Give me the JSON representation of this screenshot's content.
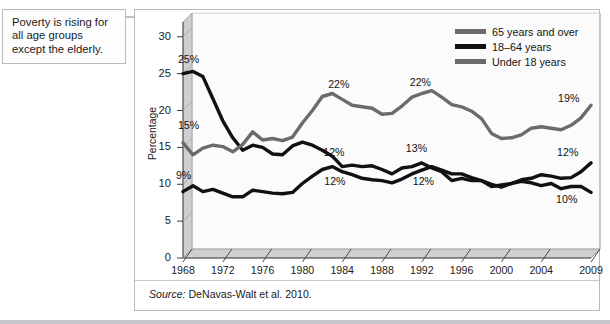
{
  "callout": {
    "text": "Poverty is rising for all age groups except the elderly.",
    "arrow_icon": "arrow-right-icon"
  },
  "source": {
    "label": "Source:",
    "citation": " DeNavas-Walt et al. 2010."
  },
  "legend": {
    "items": [
      {
        "label": "65 years and over",
        "color": "#6b6b6b"
      },
      {
        "label": "18–64 years",
        "color": "#111111"
      },
      {
        "label": "Under 18 years",
        "color": "#6b6b6b"
      }
    ]
  },
  "chart_data": {
    "type": "line",
    "title": "",
    "xlabel": "",
    "ylabel": "Percentage",
    "xlim": [
      1968,
      2009
    ],
    "ylim": [
      0,
      32
    ],
    "yticks": [
      0,
      5,
      10,
      15,
      20,
      25,
      30
    ],
    "xticks": [
      1968,
      1972,
      1976,
      1980,
      1984,
      1988,
      1992,
      1996,
      2000,
      2004,
      2009
    ],
    "grid": false,
    "legend_position": "top-right",
    "x": [
      1968,
      1969,
      1970,
      1971,
      1972,
      1973,
      1974,
      1975,
      1976,
      1977,
      1978,
      1979,
      1980,
      1981,
      1982,
      1983,
      1984,
      1985,
      1986,
      1987,
      1988,
      1989,
      1990,
      1991,
      1992,
      1993,
      1994,
      1995,
      1996,
      1997,
      1998,
      1999,
      2000,
      2001,
      2002,
      2003,
      2004,
      2005,
      2006,
      2007,
      2008,
      2009
    ],
    "series": [
      {
        "name": "65 years and over",
        "color": "#111111",
        "values": [
          25.0,
          25.3,
          24.6,
          21.6,
          18.6,
          16.3,
          14.6,
          15.3,
          15.0,
          14.1,
          14.0,
          15.2,
          15.7,
          15.3,
          14.6,
          13.8,
          12.4,
          12.6,
          12.4,
          12.5,
          12.0,
          11.4,
          12.2,
          12.4,
          12.9,
          12.2,
          11.7,
          10.5,
          10.8,
          10.5,
          10.5,
          9.7,
          9.9,
          10.1,
          10.4,
          10.2,
          9.8,
          10.1,
          9.4,
          9.7,
          9.7,
          8.9
        ]
      },
      {
        "name": "18–64 years",
        "color": "#111111",
        "values": [
          9.0,
          9.8,
          9.0,
          9.3,
          8.8,
          8.3,
          8.3,
          9.2,
          9.0,
          8.8,
          8.7,
          8.9,
          10.1,
          11.1,
          12.0,
          12.4,
          11.7,
          11.3,
          10.8,
          10.6,
          10.5,
          10.2,
          10.7,
          11.4,
          11.9,
          12.4,
          11.9,
          11.4,
          11.4,
          10.9,
          10.5,
          10.0,
          9.6,
          10.1,
          10.6,
          10.8,
          11.3,
          11.1,
          10.8,
          10.9,
          11.7,
          12.9
        ]
      },
      {
        "name": "Under 18 years",
        "color": "#6b6b6b",
        "values": [
          15.6,
          14.0,
          14.9,
          15.3,
          15.1,
          14.4,
          15.4,
          17.1,
          16.0,
          16.2,
          15.9,
          16.4,
          18.3,
          20.0,
          21.9,
          22.3,
          21.5,
          20.7,
          20.5,
          20.3,
          19.5,
          19.6,
          20.6,
          21.8,
          22.3,
          22.7,
          21.8,
          20.8,
          20.5,
          19.9,
          18.9,
          16.9,
          16.2,
          16.3,
          16.7,
          17.6,
          17.8,
          17.6,
          17.4,
          18.0,
          19.0,
          20.7
        ]
      }
    ],
    "point_labels": [
      {
        "text": "25%",
        "x": 1968.6,
        "y": 26.9,
        "series": "65 years and over"
      },
      {
        "text": "15%",
        "x": 1968.6,
        "y": 17.9,
        "series": "Under 18 years"
      },
      {
        "text": "9%",
        "x": 1968.4,
        "y": 11.1,
        "series": "18–64 years"
      },
      {
        "text": "22%",
        "x": 1983.7,
        "y": 23.4,
        "series": "Under 18 years"
      },
      {
        "text": "12%",
        "x": 1983.2,
        "y": 14.3,
        "series": "65 years and over"
      },
      {
        "text": "12%",
        "x": 1983.3,
        "y": 10.3,
        "series": "18–64 years"
      },
      {
        "text": "22%",
        "x": 1991.9,
        "y": 23.7,
        "series": "Under 18 years"
      },
      {
        "text": "13%",
        "x": 1991.5,
        "y": 14.8,
        "series": "65 years and over"
      },
      {
        "text": "12%",
        "x": 1992.2,
        "y": 10.3,
        "series": "18–64 years"
      },
      {
        "text": "19%",
        "x": 2006.8,
        "y": 21.6,
        "series": "Under 18 years"
      },
      {
        "text": "12%",
        "x": 2006.7,
        "y": 14.3,
        "series": "18–64 years"
      },
      {
        "text": "10%",
        "x": 2006.6,
        "y": 7.8,
        "series": "65 years and over"
      }
    ]
  }
}
